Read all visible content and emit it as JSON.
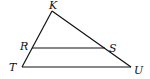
{
  "diagram": {
    "type": "triangle-with-parallel-segment",
    "stroke_color": "#111111",
    "background": "#ffffff",
    "vertices": {
      "K": {
        "label": "K",
        "x": 52,
        "y": 11
      },
      "T": {
        "label": "T",
        "x": 22,
        "y": 67
      },
      "U": {
        "label": "U",
        "x": 131,
        "y": 67
      },
      "R": {
        "label": "R",
        "x": 32,
        "y": 48
      },
      "S": {
        "label": "S",
        "x": 105,
        "y": 48
      }
    },
    "segments": [
      {
        "from": "K",
        "to": "T"
      },
      {
        "from": "K",
        "to": "U"
      },
      {
        "from": "T",
        "to": "U"
      },
      {
        "from": "R",
        "to": "S"
      }
    ],
    "labels": {
      "K": {
        "text": "K",
        "x": 49,
        "y": 9
      },
      "R": {
        "text": "R",
        "x": 20,
        "y": 50
      },
      "S": {
        "text": "S",
        "x": 109,
        "y": 52
      },
      "T": {
        "text": "T",
        "x": 9,
        "y": 71
      },
      "U": {
        "text": "U",
        "x": 134,
        "y": 74
      }
    }
  }
}
